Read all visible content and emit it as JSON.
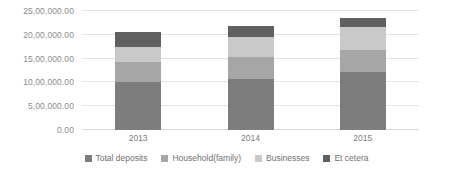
{
  "chart_data": {
    "type": "bar",
    "subtype": "stacked-column",
    "title": "",
    "xlabel": "",
    "ylabel": "",
    "categories": [
      "2013",
      "2014",
      "2015"
    ],
    "series": [
      {
        "name": "Total deposits",
        "color": "#7d7d7d",
        "values": [
          1010000,
          1080000,
          1210000
        ]
      },
      {
        "name": "Household(family)",
        "color": "#a6a6a6",
        "values": [
          420000,
          460000,
          480000
        ]
      },
      {
        "name": "Businesses",
        "color": "#c9c9c9",
        "values": [
          320000,
          420000,
          470000
        ]
      },
      {
        "name": "Et cetera",
        "color": "#606060",
        "values": [
          300000,
          220000,
          190000
        ]
      }
    ],
    "totals": [
      2050000,
      2180000,
      2350000
    ],
    "ylim": [
      0,
      2500000
    ],
    "ytick_values": [
      0,
      500000,
      1000000,
      1500000,
      2000000,
      2500000
    ],
    "ytick_labels": [
      "0.00",
      "5,00,000.00",
      "10,00,000.00",
      "15,00,000.00",
      "20,00,000.00",
      "25,00,000.00"
    ],
    "grid": true,
    "legend_position": "bottom",
    "number_format": "indian-lakh-grouping"
  },
  "legend": {
    "items": [
      {
        "label": "Total deposits"
      },
      {
        "label": "Household(family)"
      },
      {
        "label": "Businesses"
      },
      {
        "label": "Et cetera"
      }
    ]
  },
  "colors": {
    "total_deposits": "#7d7d7d",
    "household": "#a6a6a6",
    "businesses": "#c9c9c9",
    "et_cetera": "#606060",
    "gridline": "#e3e3e3",
    "tick_text": "#8b8b8b",
    "background": "#ffffff"
  }
}
